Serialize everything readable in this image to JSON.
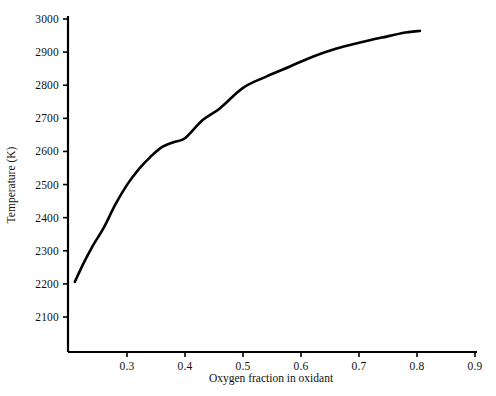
{
  "chart_data": {
    "type": "line",
    "title": "",
    "xlabel": "Oxygen fraction in oxidant",
    "ylabel": "Temperature (K)",
    "xlim": [
      0.21,
      0.9
    ],
    "ylim": [
      2040,
      3000
    ],
    "grid": false,
    "legend": null,
    "xticks": [
      0.3,
      0.4,
      0.5,
      0.6,
      0.7,
      0.8,
      0.9
    ],
    "xtick_labels": [
      "0.3",
      "0.4",
      "0.5",
      "0.6",
      "0.7",
      "0.8",
      "0.9"
    ],
    "yticks": [
      2100,
      2200,
      2300,
      2400,
      2500,
      2600,
      2700,
      2800,
      2900,
      3000
    ],
    "ytick_labels": [
      "2100",
      "2200",
      "2300",
      "2400",
      "2500",
      "2600",
      "2700",
      "2800",
      "2900",
      "3000"
    ],
    "series": [
      {
        "name": "Adiabatic flame temperature",
        "color": "#000000",
        "line_width": 2.6,
        "x": [
          0.21,
          0.225,
          0.24,
          0.26,
          0.28,
          0.3,
          0.32,
          0.34,
          0.36,
          0.38,
          0.4,
          0.43,
          0.46,
          0.5,
          0.54,
          0.58,
          0.62,
          0.66,
          0.7,
          0.74,
          0.78,
          0.805
        ],
        "y": [
          2206,
          2262,
          2312,
          2370,
          2440,
          2499,
          2546,
          2583,
          2613,
          2628,
          2640,
          2694,
          2730,
          2792,
          2826,
          2856,
          2886,
          2910,
          2928,
          2944,
          2959,
          2964
        ]
      }
    ]
  },
  "axes": {
    "y_axis_name": "temperature-axis",
    "x_axis_name": "oxygen-fraction-axis"
  }
}
